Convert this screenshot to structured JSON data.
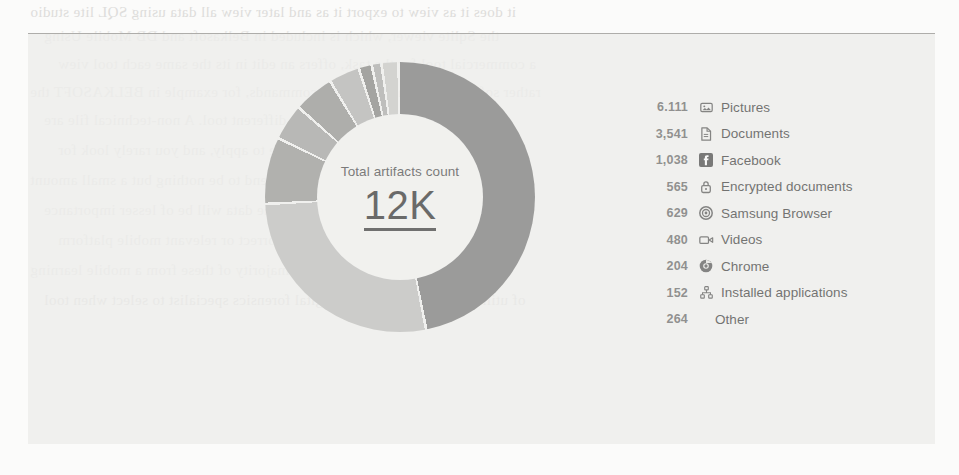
{
  "page": {
    "bleed_text": [
      "it does it as view to export it as and later view all data using SQL lite studio",
      "the Sqlite viewer, which is included in Belkasoft and DB Mobile Using",
      "a commercial tool for the task, offers an edit in its the same each tool view",
      "rather software kits and SQL level commands, for example in BELKASOFT the",
      "is practically the same with a different tool. A non-technical file are",
      "knowing at is more a beneficial practice to apply, and you rarely look for",
      "SQLite databases and tables, they tend to be nothing but a small amount",
      "which means that a large percentage of the data will be of lesser importance",
      "here more than in the latter case a correct or relevant mobile platform",
      "component architecture. Yes, the majority of these from a mobile learning",
      "of utilized, the choice for the digital forensics specialist to select when tool"
    ]
  },
  "chart_data": {
    "type": "pie",
    "variant": "donut",
    "title": "Total artifacts count",
    "center_value": "12K",
    "total_artifacts": 12000,
    "legend_position": "right",
    "start_angle_deg": 0,
    "direction": "clockwise",
    "categories": [
      "Pictures",
      "Documents",
      "Facebook",
      "Encrypted documents",
      "Samsung Browser",
      "Videos",
      "Chrome",
      "Installed applications",
      "Other"
    ],
    "values": [
      6111,
      3541,
      1038,
      565,
      629,
      480,
      204,
      152,
      264
    ],
    "value_labels": [
      "6.111",
      "3,541",
      "1,038",
      "565",
      "629",
      "480",
      "204",
      "152",
      "264"
    ],
    "icons": [
      "pictures-icon",
      "document-icon",
      "facebook-icon",
      "lock-icon",
      "samsung-browser-icon",
      "video-icon",
      "chrome-icon",
      "installed-applications-icon",
      "none"
    ],
    "colors": [
      "#6e6e6e",
      "#b9b9b7",
      "#8f8f8d",
      "#9a9a98",
      "#8a8a88",
      "#adadab",
      "#7b7b79",
      "#a3a3a1",
      "#c3c3c1"
    ]
  },
  "legend": {
    "rows": [
      {
        "value": "6.111",
        "label": "Pictures",
        "icon": "pictures-icon"
      },
      {
        "value": "3,541",
        "label": "Documents",
        "icon": "document-icon"
      },
      {
        "value": "1,038",
        "label": "Facebook",
        "icon": "facebook-icon"
      },
      {
        "value": "565",
        "label": "Encrypted documents",
        "icon": "lock-icon"
      },
      {
        "value": "629",
        "label": "Samsung Browser",
        "icon": "samsung-browser-icon"
      },
      {
        "value": "480",
        "label": "Videos",
        "icon": "video-icon"
      },
      {
        "value": "204",
        "label": "Chrome",
        "icon": "chrome-icon"
      },
      {
        "value": "152",
        "label": "Installed applications",
        "icon": "installed-applications-icon"
      },
      {
        "value": "264",
        "label": "Other",
        "icon": "none"
      }
    ]
  }
}
